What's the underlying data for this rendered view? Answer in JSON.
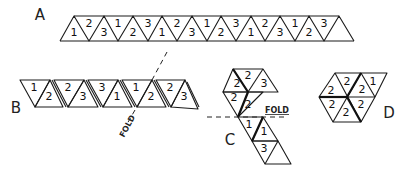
{
  "figure": {
    "panels": [
      {
        "label": "A",
        "numbers": [
          "1",
          "2",
          "3",
          "1",
          "2",
          "3",
          "1",
          "2",
          "3",
          "1",
          "2",
          "3",
          "1",
          "2",
          "3",
          "1",
          "2",
          "3"
        ]
      },
      {
        "label": "B",
        "numbers": [
          "1",
          "2",
          "2",
          "3",
          "3",
          "1",
          "1",
          "2",
          "2",
          "3"
        ],
        "fold_label": "FOLD"
      },
      {
        "label": "C",
        "numbers": [
          "2",
          "2",
          "3",
          "2",
          "2",
          "1",
          "1",
          "3"
        ],
        "fold_label": "FOLD"
      },
      {
        "label": "D",
        "numbers": [
          "2",
          "2",
          "2",
          "1",
          "2",
          "2",
          "2"
        ]
      }
    ]
  }
}
